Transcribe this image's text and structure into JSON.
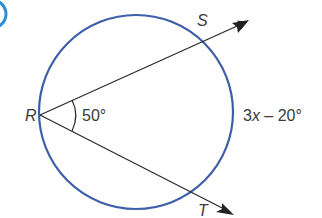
{
  "diagram": {
    "type": "circle-secant-angle",
    "colors": {
      "circle": "#3d5fa8",
      "lines": "#2b2b2b",
      "text": "#3a3a3a",
      "badge": "#2a8fd6"
    },
    "points": {
      "R": "R",
      "S": "S",
      "T": "T"
    },
    "angle_label": "50°",
    "arc_label_x": "3",
    "arc_label_var": "x",
    "arc_label_rest": " – 20°"
  }
}
